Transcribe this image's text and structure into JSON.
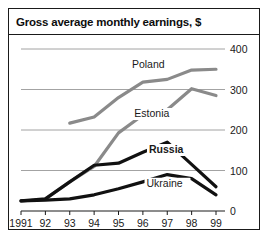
{
  "chart_data": {
    "type": "line",
    "title": "Gross average monthly earnings, $",
    "xlabel": "",
    "ylabel": "",
    "x": [
      1991,
      1992,
      1993,
      1994,
      1995,
      1996,
      1997,
      1998,
      1999
    ],
    "xtick_labels": [
      "1991",
      "92",
      "93",
      "94",
      "95",
      "96",
      "97",
      "98",
      "99"
    ],
    "ytick_labels": [
      "0",
      "100",
      "200",
      "300",
      "400"
    ],
    "yticks": [
      0,
      100,
      200,
      300,
      400
    ],
    "ylim": [
      0,
      400
    ],
    "grid": true,
    "legend_position": "inline-labels",
    "series": [
      {
        "name": "Poland",
        "color": "#8a8a8a",
        "label_bold": false,
        "x": [
          1993,
          1994,
          1995,
          1996,
          1997,
          1998,
          1999
        ],
        "values": [
          217,
          232,
          280,
          318,
          325,
          348,
          350
        ]
      },
      {
        "name": "Estonia",
        "color": "#8a8a8a",
        "label_bold": false,
        "x": [
          1992,
          1993,
          1994,
          1995,
          1996,
          1997,
          1998,
          1999
        ],
        "values": [
          30,
          72,
          110,
          193,
          237,
          250,
          302,
          285
        ]
      },
      {
        "name": "Russia",
        "color": "#111111",
        "label_bold": true,
        "x": [
          1991,
          1992,
          1993,
          1994,
          1995,
          1996,
          1997,
          1998,
          1999
        ],
        "values": [
          25,
          30,
          72,
          113,
          118,
          145,
          170,
          115,
          60
        ]
      },
      {
        "name": "Ukraine",
        "color": "#111111",
        "label_bold": false,
        "x": [
          1991,
          1992,
          1993,
          1994,
          1995,
          1996,
          1997,
          1998,
          1999
        ],
        "values": [
          25,
          27,
          30,
          40,
          55,
          72,
          90,
          80,
          40
        ]
      }
    ],
    "series_label_positions": [
      {
        "name": "Poland",
        "x": 1995.55,
        "y": 352
      },
      {
        "name": "Estonia",
        "x": 1995.65,
        "y": 232
      },
      {
        "name": "Russia",
        "x": 1996.25,
        "y": 143
      },
      {
        "name": "Ukraine",
        "x": 1996.15,
        "y": 60
      }
    ]
  }
}
